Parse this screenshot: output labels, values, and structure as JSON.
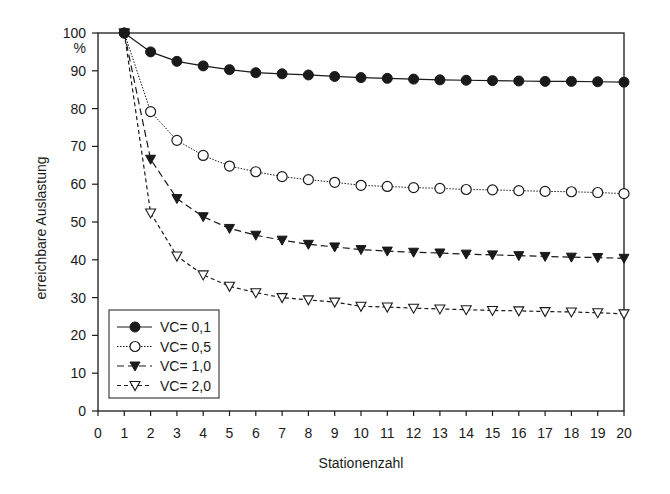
{
  "chart_data": {
    "type": "line",
    "title": "",
    "xlabel": "Stationenzahl",
    "ylabel": "erreichbare Auslastung",
    "yunit_label": "%",
    "xlim": [
      0,
      20
    ],
    "ylim": [
      0,
      100
    ],
    "x_ticks": [
      0,
      1,
      2,
      3,
      4,
      5,
      6,
      7,
      8,
      9,
      10,
      11,
      12,
      13,
      14,
      15,
      16,
      17,
      18,
      19,
      20
    ],
    "y_ticks": [
      0,
      10,
      20,
      30,
      40,
      50,
      60,
      70,
      80,
      90,
      100
    ],
    "grid": false,
    "legend_position": "lower-left",
    "x": [
      1,
      2,
      3,
      4,
      5,
      6,
      7,
      8,
      9,
      10,
      11,
      12,
      13,
      14,
      15,
      16,
      17,
      18,
      19,
      20
    ],
    "series": [
      {
        "name": "VC= 0,1",
        "marker": "filled-circle",
        "line": "solid",
        "values": [
          100,
          95.0,
          92.5,
          91.3,
          90.3,
          89.5,
          89.2,
          88.9,
          88.5,
          88.2,
          88.0,
          87.8,
          87.6,
          87.5,
          87.4,
          87.3,
          87.2,
          87.2,
          87.1,
          87.0
        ]
      },
      {
        "name": "VC= 0,5",
        "marker": "open-circle",
        "line": "dotted",
        "values": [
          100,
          79.2,
          71.6,
          67.6,
          64.8,
          63.3,
          62.0,
          61.2,
          60.5,
          59.7,
          59.4,
          59.1,
          58.9,
          58.6,
          58.5,
          58.3,
          58.1,
          58.0,
          57.8,
          57.5
        ]
      },
      {
        "name": "VC= 1,0",
        "marker": "filled-down-triangle",
        "line": "dashed",
        "values": [
          100,
          66.6,
          56.2,
          51.4,
          48.3,
          46.5,
          45.2,
          44.1,
          43.4,
          42.7,
          42.3,
          42.0,
          41.8,
          41.5,
          41.3,
          41.1,
          40.9,
          40.7,
          40.6,
          40.4
        ]
      },
      {
        "name": "VC= 2,0",
        "marker": "open-down-triangle",
        "line": "short-dashed",
        "values": [
          100,
          52.4,
          41.0,
          36.0,
          33.0,
          31.3,
          30.0,
          29.4,
          28.8,
          27.7,
          27.5,
          27.2,
          27.0,
          26.8,
          26.6,
          26.5,
          26.3,
          26.2,
          26.0,
          25.7
        ]
      }
    ]
  }
}
